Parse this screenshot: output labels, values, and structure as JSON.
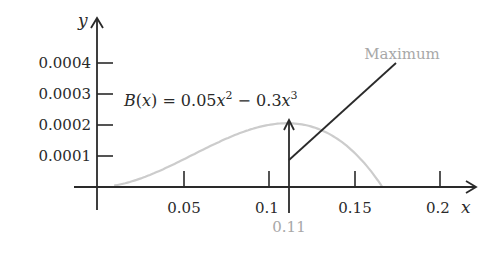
{
  "chart_data": {
    "type": "line",
    "title": "",
    "function": "B(x) = 0.05x^2 - 0.3x^3",
    "xlabel": "x",
    "ylabel": "y",
    "xlim": [
      0,
      0.2
    ],
    "ylim": [
      0,
      0.0004
    ],
    "x_ticks": [
      0.05,
      0.1,
      0.15,
      0.2
    ],
    "x_tick_labels": [
      "0.05",
      "0.1",
      "0.15",
      "0.2"
    ],
    "y_ticks": [
      0.0001,
      0.0002,
      0.0003,
      0.0004
    ],
    "y_tick_labels": [
      "0.0001",
      "0.0002",
      "0.0003",
      "0.0004"
    ],
    "grid": false,
    "series": [
      {
        "name": "B(x) = 0.05x^2 - 0.3x^3",
        "color": "#cccccc",
        "x": [
          0,
          0.02,
          0.04,
          0.06,
          0.08,
          0.1,
          0.111,
          0.12,
          0.14,
          0.16,
          0.1667
        ],
        "y": [
          0,
          1.76e-05,
          6.08e-05,
          0.0001152,
          0.0001664,
          0.0002,
          0.000206,
          0.0002016,
          0.0001568,
          5.12e-05,
          0
        ]
      }
    ],
    "annotations": [
      {
        "text": "Maximum",
        "color": "#a8a8a8",
        "points_to": [
          0.11,
          0.000206
        ]
      },
      {
        "text": "0.11",
        "color": "#a8a8a8",
        "x": 0.11
      }
    ]
  },
  "labels": {
    "y_axis": "y",
    "x_axis": "x",
    "y_ticks": [
      "0.0004",
      "0.0003",
      "0.0002",
      "0.0001"
    ],
    "x_ticks": [
      "0.05",
      "0.1",
      "0.15",
      "0.2"
    ],
    "formula_B": "B",
    "formula_paren_open": "(",
    "formula_x": "x",
    "formula_mid": ") = 0.05",
    "formula_x2": "x",
    "formula_exp2": "2",
    "formula_minus": " − 0.3",
    "formula_x3": "x",
    "formula_exp3": "3",
    "maximum": "Maximum",
    "max_x": "0.11"
  },
  "colors": {
    "axis": "#2a2a2a",
    "curve": "#cccccc",
    "annotation": "#a8a8a8"
  }
}
